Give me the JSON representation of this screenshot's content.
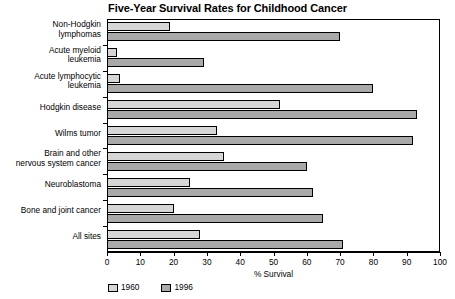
{
  "chart_data": {
    "type": "bar",
    "orientation": "horizontal",
    "title": "Five-Year Survival Rates for Childhood Cancer",
    "xlabel": "% Survival",
    "ylabel": "",
    "xlim": [
      0,
      100
    ],
    "xticks": [
      0,
      10,
      20,
      30,
      40,
      50,
      60,
      70,
      80,
      90,
      100
    ],
    "grid": false,
    "legend_position": "bottom-left",
    "categories": [
      "Non-Hodgkin lymphomas",
      "Acute myeloid leukemia",
      "Acute lymphocytic leukemia",
      "Hodgkin disease",
      "Wilms tumor",
      "Brain and other nervous system cancer",
      "Neuroblastoma",
      "Bone and joint cancer",
      "All sites"
    ],
    "category_lines": [
      [
        "Non-Hodgkin",
        "lymphomas"
      ],
      [
        "Acute myeloid",
        "leukemia"
      ],
      [
        "Acute lymphocytic",
        "leukemia"
      ],
      [
        "Hodgkin disease"
      ],
      [
        "Wilms tumor"
      ],
      [
        "Brain and other",
        "nervous system cancer"
      ],
      [
        "Neuroblastoma"
      ],
      [
        "Bone and joint cancer"
      ],
      [
        "All sites"
      ]
    ],
    "series": [
      {
        "name": "1960",
        "color": "#d6d6d6",
        "values": [
          19,
          3,
          4,
          52,
          33,
          35,
          25,
          20,
          28
        ]
      },
      {
        "name": "1996",
        "color": "#a9a9a9",
        "values": [
          70,
          29,
          80,
          93,
          92,
          60,
          62,
          65,
          71
        ]
      }
    ]
  },
  "legend": {
    "items": [
      {
        "label": "1960",
        "swatch": "y1960"
      },
      {
        "label": "1996",
        "swatch": "y1996"
      }
    ]
  }
}
